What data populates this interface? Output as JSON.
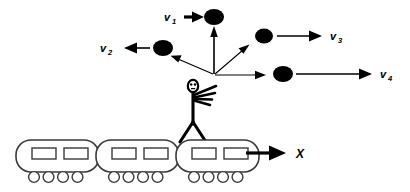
{
  "figure": {
    "background_color": "#ffffff",
    "ink_color": "#000000",
    "train_outline_color": "#3a3a3a",
    "width": 410,
    "height": 192
  },
  "labels": {
    "v1": {
      "symbol": "v",
      "subscript": "1",
      "text": "v1"
    },
    "v2": {
      "symbol": "v",
      "subscript": "2",
      "text": "v2"
    },
    "v3": {
      "symbol": "v",
      "subscript": "3",
      "text": "v3"
    },
    "v4": {
      "symbol": "v",
      "subscript": "4",
      "text": "v4"
    },
    "x_axis": {
      "text": "X"
    }
  },
  "vectors": [
    {
      "name": "v1",
      "label": "v1",
      "direction": "up",
      "origin": [
        214,
        75
      ],
      "ball": [
        214,
        17
      ],
      "label_pos": [
        170,
        16
      ],
      "arrow_to_label": "short-right-arrow-into-ball"
    },
    {
      "name": "v2",
      "label": "v2",
      "direction": "up-left",
      "origin": [
        214,
        75
      ],
      "ball": [
        162,
        48
      ],
      "label_pos": [
        103,
        49
      ],
      "arrow_to_label": "left-arrow-from-ball"
    },
    {
      "name": "v3",
      "label": "v3",
      "direction": "up-right",
      "origin": [
        214,
        75
      ],
      "ball": [
        263,
        36
      ],
      "label_pos": [
        331,
        37
      ],
      "arrow_to_label": "right-arrow-from-ball"
    },
    {
      "name": "v4",
      "label": "v4",
      "direction": "right",
      "origin": [
        214,
        75
      ],
      "ball": [
        283,
        74
      ],
      "label_pos": [
        383,
        75
      ],
      "arrow_to_label": "long-right-arrow-from-ball"
    }
  ],
  "train": {
    "cars": [
      {
        "index": 1,
        "x": 16,
        "y": 140,
        "width": 83,
        "height": 32,
        "windows": 2,
        "wheels": 4
      },
      {
        "index": 2,
        "x": 96,
        "y": 140,
        "width": 83,
        "height": 32,
        "windows": 2,
        "wheels": 4
      },
      {
        "index": 3,
        "x": 176,
        "y": 140,
        "width": 83,
        "height": 32,
        "windows": 2,
        "wheels": 4
      }
    ],
    "motion_arrow": {
      "from": [
        246,
        153
      ],
      "to": [
        288,
        153
      ],
      "label": "X"
    }
  },
  "person": {
    "name": "juggler",
    "head": [
      193,
      86
    ],
    "body_top": [
      193,
      93
    ],
    "body_bottom": [
      193,
      124
    ],
    "legs": [
      [
        180,
        142
      ],
      [
        207,
        142
      ]
    ],
    "arm_strokes": 4
  }
}
